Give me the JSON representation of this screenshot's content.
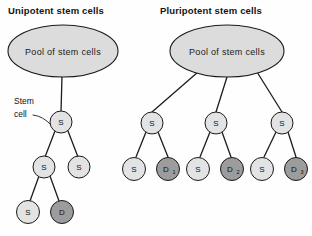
{
  "figure": {
    "background_color": "#fefefe",
    "line_color": "#1c1c1c",
    "stem_fill": "#e3e3e3",
    "diff_fill": "#9c9c9c",
    "pool_fill": "#dcdcdc"
  },
  "panels": [
    {
      "id": "unipotent",
      "title": "Unipotent stem cells",
      "pool": {
        "label": "Pool of stem cells"
      },
      "callout": {
        "line1": "Stem",
        "line2": "cell"
      },
      "nodes": [
        {
          "id": "u-s0",
          "label": "S",
          "sub": "",
          "type": "stem"
        },
        {
          "id": "u-s1",
          "label": "S",
          "sub": "",
          "type": "stem"
        },
        {
          "id": "u-s2",
          "label": "S",
          "sub": "",
          "type": "stem"
        },
        {
          "id": "u-s3",
          "label": "S",
          "sub": "",
          "type": "stem"
        },
        {
          "id": "u-d1",
          "label": "D",
          "sub": "",
          "type": "differentiated"
        }
      ]
    },
    {
      "id": "pluripotent",
      "title": "Pluripotent stem cells",
      "pool": {
        "label": "Pool of stem cells"
      },
      "nodes": [
        {
          "id": "p-s-left",
          "label": "S",
          "sub": "",
          "type": "stem"
        },
        {
          "id": "p-s-mid",
          "label": "S",
          "sub": "",
          "type": "stem"
        },
        {
          "id": "p-s-right",
          "label": "S",
          "sub": "",
          "type": "stem"
        },
        {
          "id": "p-s1",
          "label": "S",
          "sub": "",
          "type": "stem"
        },
        {
          "id": "p-d1",
          "label": "D",
          "sub": "1",
          "type": "differentiated"
        },
        {
          "id": "p-s2",
          "label": "S",
          "sub": "",
          "type": "stem"
        },
        {
          "id": "p-d2",
          "label": "D",
          "sub": "2",
          "type": "differentiated"
        },
        {
          "id": "p-s3",
          "label": "S",
          "sub": "",
          "type": "stem"
        },
        {
          "id": "p-d3",
          "label": "D",
          "sub": "3",
          "type": "differentiated"
        }
      ]
    }
  ]
}
